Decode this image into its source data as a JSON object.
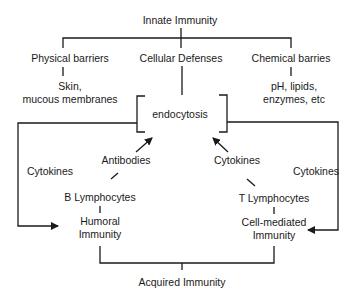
{
  "diagram": {
    "title": "Innate Immunity",
    "innate_branches": [
      {
        "label": "Physical barriers",
        "detail_line1": "Skin,",
        "detail_line2": "mucous membranes"
      },
      {
        "label": "Cellular Defenses"
      },
      {
        "label": "Chemical barries",
        "detail_line1": "pH, lipids,",
        "detail_line2": "enzymes, etc"
      }
    ],
    "center_process": "endocytosis",
    "left_branch": {
      "loop_label": "Cytokines",
      "arrow_label": "Antibodies",
      "cell": "B Lymphocytes",
      "immunity_line1": "Humoral",
      "immunity_line2": "Immunity"
    },
    "right_branch": {
      "loop_label": "Cytokines",
      "arrow_label": "Cytokines",
      "cell": "T Lymphocytes",
      "immunity_line1": "Cell-mediated",
      "immunity_line2": "Immunity"
    },
    "bottom": "Acquired Immunity",
    "line_color": "#1a1a1a"
  }
}
